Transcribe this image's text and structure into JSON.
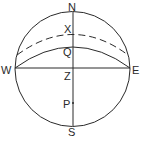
{
  "diagram": {
    "type": "celestial-sphere",
    "labels": {
      "north": "N",
      "south": "S",
      "west": "W",
      "east": "E",
      "x_point": "X",
      "q_point": "Q",
      "zenith": "Z",
      "p_point": "P"
    },
    "stroke_color": "#2a2a2a",
    "background": "#ffffff"
  }
}
